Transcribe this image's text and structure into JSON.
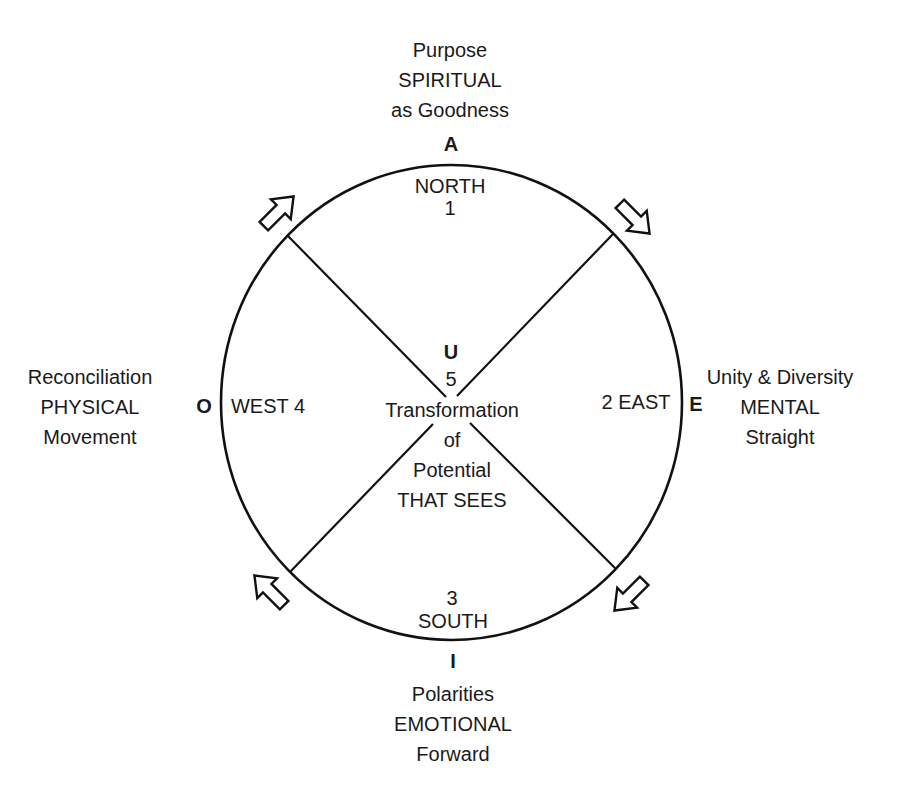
{
  "diagram": {
    "north": {
      "outer_lines": [
        "Purpose",
        "SPIRITUAL",
        "as Goodness"
      ],
      "vowel": "A",
      "direction": "NORTH",
      "number": "1"
    },
    "east": {
      "outer_lines": [
        "Unity & Diversity",
        "MENTAL",
        "Straight"
      ],
      "vowel": "E",
      "label": "2 EAST"
    },
    "south": {
      "outer_lines": [
        "Polarities",
        "EMOTIONAL",
        "Forward"
      ],
      "vowel": "I",
      "direction": "SOUTH",
      "number": "3"
    },
    "west": {
      "outer_lines": [
        "Reconciliation",
        "PHYSICAL",
        "Movement"
      ],
      "vowel": "O",
      "label": "WEST 4"
    },
    "center": {
      "vowel": "U",
      "number": "5",
      "lines": [
        "Transformation",
        "of",
        "Potential",
        "THAT SEES"
      ]
    },
    "arrows": [
      {
        "position": "upper-left",
        "direction": "north-east"
      },
      {
        "position": "upper-right",
        "direction": "south-east"
      },
      {
        "position": "lower-right",
        "direction": "south-west"
      },
      {
        "position": "lower-left",
        "direction": "north-west"
      }
    ],
    "colors": {
      "stroke": "#111111",
      "background": "#ffffff",
      "text": "#1a1a1a"
    }
  }
}
